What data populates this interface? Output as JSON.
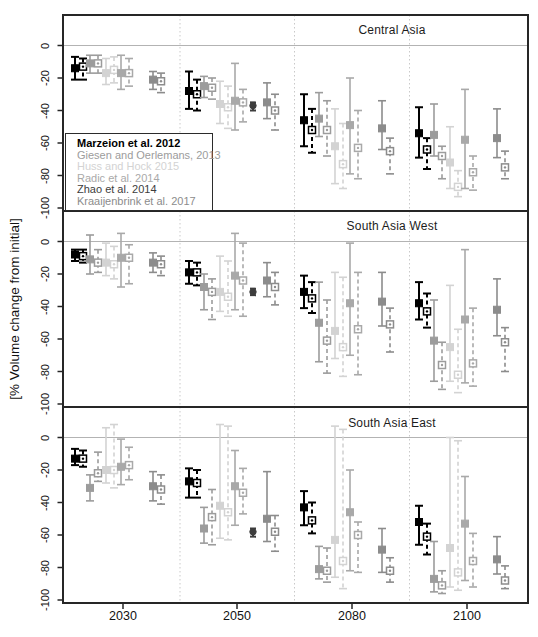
{
  "figure": {
    "ylabel": "[% Volume change from initial]",
    "x_ticks": [
      "2030",
      "2050",
      "2080",
      "2100"
    ],
    "y_ticks": [
      "0",
      "-20",
      "-40",
      "-60",
      "-80",
      "-100"
    ]
  },
  "legend": {
    "entries": [
      {
        "id": "marzeion",
        "label": "Marzeion et al. 2012",
        "color": "#000000",
        "bold": true
      },
      {
        "id": "giesen",
        "label": "Giesen and Oerlemans, 2013",
        "color": "#9c9c9c",
        "bold": false
      },
      {
        "id": "huss",
        "label": "Huss and Hock 2015",
        "color": "#d3d3d3",
        "bold": false
      },
      {
        "id": "radic",
        "label": "Radic et al. 2014",
        "color": "#a9a9a9",
        "bold": false
      },
      {
        "id": "zhao",
        "label": "Zhao et al. 2014",
        "color": "#3d3d3d",
        "bold": false
      },
      {
        "id": "kraaijenbrink",
        "label": "Kraaijenbrink et al. 2017",
        "color": "#8c8c8c",
        "bold": false
      }
    ]
  },
  "chart_data": {
    "type": "errorbar",
    "x_type": "categorical",
    "categories": [
      2030,
      2050,
      2080,
      2100
    ],
    "ylabel": "[% Volume change from initial]",
    "ylim": [
      18,
      -105
    ],
    "grid": "dotted vertical separators between category clusters, light solid line at 0",
    "value_format": "[central, upper, lower] in % volume change from initial; dashed = open-symbol scenario, solid = filled-symbol scenario; Zhao et al. 2014 has a single 2050 point per panel",
    "studies": [
      {
        "id": "marzeion",
        "marker": "filled-square / open-square",
        "line": 2.0
      },
      {
        "id": "giesen",
        "marker": "filled-square / open-square",
        "line": 1.6
      },
      {
        "id": "huss",
        "marker": "filled-square / open-square",
        "line": 1.6
      },
      {
        "id": "radic",
        "marker": "filled-square / open-square",
        "line": 1.6
      },
      {
        "id": "zhao",
        "marker": "filled-circle",
        "line": 2.0
      },
      {
        "id": "kraaijenbrink",
        "marker": "filled-square / open-square",
        "line": 1.6
      }
    ],
    "panels": [
      {
        "title": "Central Asia",
        "series": {
          "marzeion": {
            "solid": [
              [
                -14,
                -7,
                -21
              ],
              [
                -28,
                -16,
                -39
              ],
              [
                -46,
                -30,
                -62
              ],
              [
                -54,
                -38,
                -69
              ]
            ],
            "dashed": [
              [
                -13,
                -8,
                -21
              ],
              [
                -30,
                -21,
                -40
              ],
              [
                -52,
                -39,
                -66
              ],
              [
                -64,
                -57,
                -76
              ]
            ]
          },
          "giesen": {
            "solid": [
              [
                -11,
                -6,
                -17
              ],
              [
                -25,
                -19,
                -32
              ],
              [
                -45,
                -29,
                -56
              ],
              [
                -55,
                -36,
                -68
              ]
            ],
            "dashed": [
              [
                -11,
                -6,
                -17
              ],
              [
                -26,
                -20,
                -33
              ],
              [
                -52,
                -34,
                -68
              ],
              [
                -68,
                -62,
                -82
              ]
            ]
          },
          "huss": {
            "solid": [
              [
                -17,
                -8,
                -24
              ],
              [
                -36,
                -22,
                -48
              ],
              [
                -62,
                -39,
                -85
              ],
              [
                -72,
                -50,
                -88
              ]
            ],
            "dashed": [
              [
                -15,
                -7,
                -23
              ],
              [
                -38,
                -25,
                -51
              ],
              [
                -73,
                -48,
                -88
              ],
              [
                -87,
                -77,
                -93
              ]
            ]
          },
          "radic": {
            "solid": [
              [
                -17,
                -6,
                -27
              ],
              [
                -34,
                -11,
                -52
              ],
              [
                -49,
                -20,
                -79
              ],
              [
                -58,
                -27,
                -88
              ]
            ],
            "dashed": [
              [
                -17,
                -8,
                -25
              ],
              [
                -35,
                -27,
                -47
              ],
              [
                -63,
                -40,
                -82
              ],
              [
                -78,
                -68,
                -89
              ]
            ]
          },
          "zhao": {
            "solid": [
              null,
              [
                -37,
                -35,
                -40
              ],
              null,
              null
            ]
          },
          "kraaijenbrink": {
            "solid": [
              [
                -21,
                -16,
                -27
              ],
              [
                -35,
                -23,
                -45
              ],
              [
                -51,
                -34,
                -64
              ],
              [
                -57,
                -39,
                -69
              ]
            ],
            "dashed": [
              [
                -22,
                -17,
                -29
              ],
              [
                -40,
                -30,
                -52
              ],
              [
                -65,
                -57,
                -79
              ],
              [
                -75,
                -65,
                -82
              ]
            ]
          }
        }
      },
      {
        "title": "South Asia West",
        "series": {
          "marzeion": {
            "solid": [
              [
                -8,
                -5,
                -12
              ],
              [
                -19,
                -12,
                -26
              ],
              [
                -31,
                -21,
                -41
              ],
              [
                -38,
                -25,
                -48
              ]
            ],
            "dashed": [
              [
                -9,
                -5,
                -13
              ],
              [
                -19,
                -13,
                -27
              ],
              [
                -35,
                -25,
                -44
              ],
              [
                -43,
                -32,
                -53
              ]
            ]
          },
          "giesen": {
            "solid": [
              [
                -11,
                4,
                -20
              ],
              [
                -28,
                -20,
                -42
              ],
              [
                -50,
                -25,
                -74
              ],
              [
                -61,
                -36,
                -86
              ]
            ],
            "dashed": [
              [
                -13,
                -5,
                -19
              ],
              [
                -31,
                -23,
                -48
              ],
              [
                -61,
                -36,
                -81
              ],
              [
                -76,
                -62,
                -91
              ]
            ]
          },
          "huss": {
            "solid": [
              [
                -13,
                -1,
                -21
              ],
              [
                -31,
                -9,
                -43
              ],
              [
                -55,
                -19,
                -72
              ],
              [
                -65,
                -27,
                -86
              ]
            ],
            "dashed": [
              [
                -14,
                -3,
                -23
              ],
              [
                -34,
                -12,
                -46
              ],
              [
                -65,
                -22,
                -83
              ],
              [
                -82,
                -54,
                -93
              ]
            ]
          },
          "radic": {
            "solid": [
              [
                -10,
                5,
                -28
              ],
              [
                -21,
                5,
                -42
              ],
              [
                -38,
                -1,
                -70
              ],
              [
                -48,
                -5,
                -87
              ]
            ],
            "dashed": [
              [
                -10,
                -2,
                -26
              ],
              [
                -24,
                -1,
                -46
              ],
              [
                -54,
                -19,
                -82
              ],
              [
                -75,
                -41,
                -89
              ]
            ]
          },
          "zhao": {
            "solid": [
              null,
              [
                -31,
                -29,
                -33
              ],
              null,
              null
            ]
          },
          "kraaijenbrink": {
            "solid": [
              [
                -13,
                -7,
                -19
              ],
              [
                -24,
                -13,
                -34
              ],
              [
                -37,
                -19,
                -52
              ],
              [
                -42,
                -23,
                -58
              ]
            ],
            "dashed": [
              [
                -14,
                -9,
                -21
              ],
              [
                -28,
                -19,
                -39
              ],
              [
                -51,
                -41,
                -68
              ],
              [
                -62,
                -53,
                -80
              ]
            ]
          }
        }
      },
      {
        "title": "South Asia East",
        "series": {
          "marzeion": {
            "solid": [
              [
                -13,
                -7,
                -17
              ],
              [
                -27,
                -19,
                -37
              ],
              [
                -43,
                -33,
                -54
              ],
              [
                -52,
                -42,
                -66
              ]
            ],
            "dashed": [
              [
                -13,
                -8,
                -18
              ],
              [
                -28,
                -20,
                -37
              ],
              [
                -51,
                -40,
                -59
              ],
              [
                -61,
                -53,
                -72
              ]
            ]
          },
          "giesen": {
            "solid": [
              [
                -31,
                -23,
                -39
              ],
              [
                -56,
                -43,
                -65
              ],
              [
                -81,
                -67,
                -87
              ],
              [
                -87,
                -64,
                -95
              ]
            ],
            "dashed": [
              [
                -22,
                -9,
                -27
              ],
              [
                -49,
                -32,
                -66
              ],
              [
                -82,
                -68,
                -89
              ],
              [
                -91,
                -82,
                -96
              ]
            ]
          },
          "huss": {
            "solid": [
              [
                -20,
                6,
                -28
              ],
              [
                -42,
                8,
                -62
              ],
              [
                -63,
                7,
                -86
              ],
              [
                -68,
                0,
                -92
              ]
            ],
            "dashed": [
              [
                -20,
                8,
                -31
              ],
              [
                -46,
                7,
                -63
              ],
              [
                -76,
                5,
                -93
              ],
              [
                -83,
                -2,
                -94
              ]
            ]
          },
          "radic": {
            "solid": [
              [
                -18,
                -1,
                -29
              ],
              [
                -30,
                -8,
                -54
              ],
              [
                -46,
                -20,
                -82
              ],
              [
                -53,
                -24,
                -88
              ]
            ],
            "dashed": [
              [
                -17,
                -6,
                -26
              ],
              [
                -34,
                -19,
                -47
              ],
              [
                -60,
                -52,
                -83
              ],
              [
                -76,
                -59,
                -92
              ]
            ]
          },
          "zhao": {
            "solid": [
              null,
              [
                -58,
                -56,
                -61
              ],
              null,
              null
            ]
          },
          "kraaijenbrink": {
            "solid": [
              [
                -30,
                -21,
                -39
              ],
              [
                -50,
                -21,
                -64
              ],
              [
                -69,
                -56,
                -83
              ],
              [
                -75,
                -61,
                -84
              ]
            ],
            "dashed": [
              [
                -32,
                -23,
                -41
              ],
              [
                -58,
                -48,
                -70
              ],
              [
                -82,
                -74,
                -89
              ],
              [
                -88,
                -79,
                -93
              ]
            ]
          }
        }
      }
    ]
  }
}
